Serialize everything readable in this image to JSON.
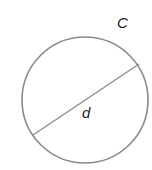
{
  "diagram": {
    "type": "circle-with-diameter",
    "labels": {
      "circumference": "C",
      "diameter": "d"
    },
    "colors": {
      "stroke": "#8a8a8a",
      "text": "#1a1a1a",
      "background": "#ffffff"
    }
  }
}
